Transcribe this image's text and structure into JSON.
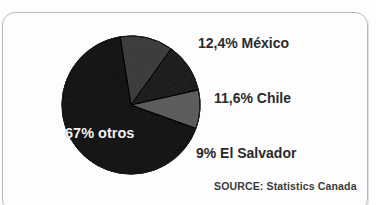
{
  "figure": {
    "clipped_header_text": "",
    "source_label": "SOURCE: Statistics Canada",
    "inside_label": "67% otros"
  },
  "labels": {
    "mexico": "12,4% México",
    "chile": "11,6% Chile",
    "salvador": "9% El Salvador",
    "otros": "67% otros"
  },
  "colors": {
    "slice_otros": "#4a4a4a",
    "slice_mexico": "#7d7d7d",
    "slice_chile": "#5a5a5a",
    "slice_salvador": "#9a9a9a",
    "slice_outline": "#1c1c1c",
    "frame_border": "#b9b9b9",
    "label_text": "#2b2b2b",
    "inside_label_text": "#f2f2f2",
    "background": "#fdfdfd"
  },
  "chart_data": {
    "type": "pie",
    "title": "",
    "subtitle": "",
    "xlabel": "",
    "ylabel": "",
    "legend_position": "callout-labels-right",
    "grid": false,
    "units": "percent",
    "total": 100,
    "categories": [
      "México",
      "Chile",
      "El Salvador",
      "otros"
    ],
    "values": [
      12.4,
      11.6,
      9,
      67
    ],
    "value_labels": [
      "12,4%",
      "11,6%",
      "9%",
      "67%"
    ],
    "data_labels": [
      "12,4% México",
      "11,6% Chile",
      "9% El Salvador",
      "67% otros"
    ],
    "slice_colors": [
      "#7d7d7d",
      "#5a5a5a",
      "#9a9a9a",
      "#4a4a4a"
    ],
    "start_angle_deg": -9,
    "direction": "clockwise",
    "annotations": [
      "SOURCE: Statistics Canada"
    ],
    "source": "SOURCE: Statistics Canada"
  },
  "geometry": {
    "center_x": 131,
    "center_y": 105,
    "radius": 69
  }
}
